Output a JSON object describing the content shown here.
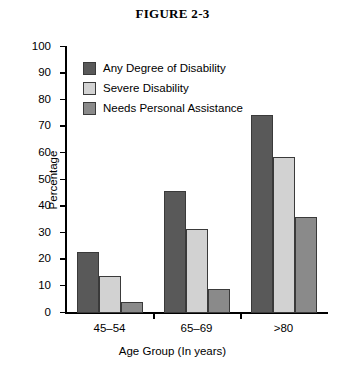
{
  "figure": {
    "title": "FIGURE 2-3"
  },
  "chart_data": {
    "type": "bar",
    "title": "FIGURE 2-3",
    "xlabel": "Age Group (In years)",
    "ylabel": "Percentage",
    "categories": [
      "45–54",
      "65–69",
      ">80"
    ],
    "ylim": [
      0,
      100
    ],
    "yticks": [
      0,
      10,
      20,
      30,
      40,
      50,
      60,
      70,
      80,
      90,
      100
    ],
    "grid": false,
    "legend_position": "top-left inside plot",
    "series": [
      {
        "name": "Any Degree of Disability",
        "color": "#595959",
        "values": [
          23,
          46,
          74.5
        ]
      },
      {
        "name": "Severe Disability",
        "color": "#d2d2d2",
        "values": [
          14,
          31.5,
          58.5
        ]
      },
      {
        "name": "Needs Personal Assistance",
        "color": "#8a8a8a",
        "values": [
          4,
          9,
          36
        ]
      }
    ]
  }
}
